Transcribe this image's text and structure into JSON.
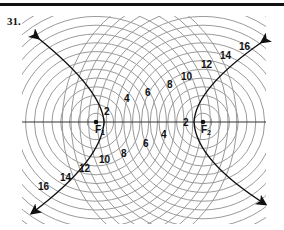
{
  "problem": {
    "number": "31."
  },
  "foci": {
    "f1": {
      "label": "F",
      "subscript": "1",
      "x": 96,
      "y": 122
    },
    "f2": {
      "label": "F",
      "subscript": "2",
      "x": 203,
      "y": 122
    }
  },
  "circle_step_px": 8.8,
  "circle_count": 16,
  "labels_upper_left_to_right": [
    "2",
    "4",
    "6",
    "8",
    "10",
    "12",
    "14",
    "16"
  ],
  "labels_lower_right_to_left": [
    "2",
    "4",
    "6",
    "8",
    "10",
    "12",
    "14",
    "16"
  ],
  "colors": {
    "circles": "#9a9a9a",
    "curve": "#111111",
    "axis": "#333333"
  }
}
